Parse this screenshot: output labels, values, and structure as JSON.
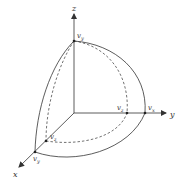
{
  "diagram": {
    "type": "3d-coordinate-octant",
    "axes": {
      "x": {
        "label": "x"
      },
      "y": {
        "label": "y"
      },
      "z": {
        "label": "z"
      }
    },
    "points": [
      {
        "id": "top",
        "label": "v",
        "sub": "y",
        "axis": "z"
      },
      {
        "id": "y-inner",
        "label": "v",
        "sub": "z",
        "axis": "y"
      },
      {
        "id": "y-outer",
        "label": "v",
        "sub": "x",
        "axis": "y"
      },
      {
        "id": "x-inner",
        "label": "v",
        "sub": "z",
        "axis": "x"
      },
      {
        "id": "x-outer",
        "label": "v",
        "sub": "y",
        "axis": "x"
      }
    ],
    "colors": {
      "line": "#333333",
      "background": "#ffffff"
    }
  }
}
